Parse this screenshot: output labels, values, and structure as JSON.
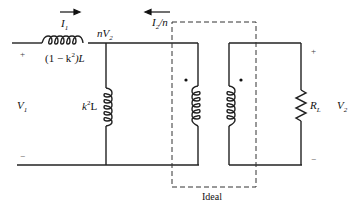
{
  "diagram": {
    "labels": {
      "i1": "I",
      "i1_sub": "1",
      "i2n": "I",
      "i2n_sub": "2",
      "i2n_tail": "/n",
      "nv2": "nV",
      "nv2_sub": "2",
      "series_inductor": "(1 − k",
      "series_inductor_sup": "2",
      "series_inductor_tail": ")L",
      "shunt_inductor": "k",
      "shunt_inductor_sup": "2",
      "shunt_inductor_tail": "L",
      "v1": "V",
      "v1_sub": "1",
      "v2": "V",
      "v2_sub": "2",
      "rl": "R",
      "rl_sub": "L",
      "plus_left": "+",
      "minus_left": "−",
      "plus_right": "+",
      "minus_right": "−",
      "ideal": "Ideal"
    },
    "colors": {
      "wire": "#222222",
      "dashed": "#333333",
      "background": "#ffffff"
    }
  }
}
